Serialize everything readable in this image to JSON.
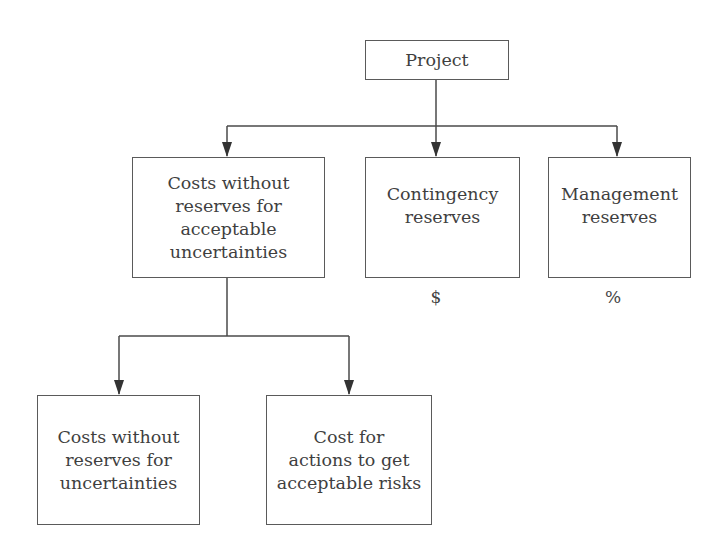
{
  "diagram": {
    "type": "hierarchy",
    "root": {
      "label": "Project"
    },
    "level1": [
      {
        "id": "costs-acceptable",
        "label": "Costs without\nreserves for\nacceptable\nuncertainties"
      },
      {
        "id": "contingency",
        "label": "Contingency\nreserves",
        "unit": "$"
      },
      {
        "id": "management",
        "label": "Management\nreserves",
        "unit": "%"
      }
    ],
    "level2": [
      {
        "id": "costs-uncertainties",
        "label": "Costs without\nreserves for\nuncertainties"
      },
      {
        "id": "cost-actions",
        "label": "Cost for\nactions to get\nacceptable risks"
      }
    ],
    "edges": [
      [
        "Project",
        "Costs without reserves for acceptable uncertainties"
      ],
      [
        "Project",
        "Contingency reserves"
      ],
      [
        "Project",
        "Management reserves"
      ],
      [
        "Costs without reserves for acceptable uncertainties",
        "Costs without reserves for uncertainties"
      ],
      [
        "Costs without reserves for acceptable uncertainties",
        "Cost for actions to get acceptable risks"
      ]
    ],
    "colors": {
      "line": "#4a4a4a",
      "border": "#5a5a5a",
      "text": "#3f3f3f",
      "background": "#ffffff"
    }
  }
}
